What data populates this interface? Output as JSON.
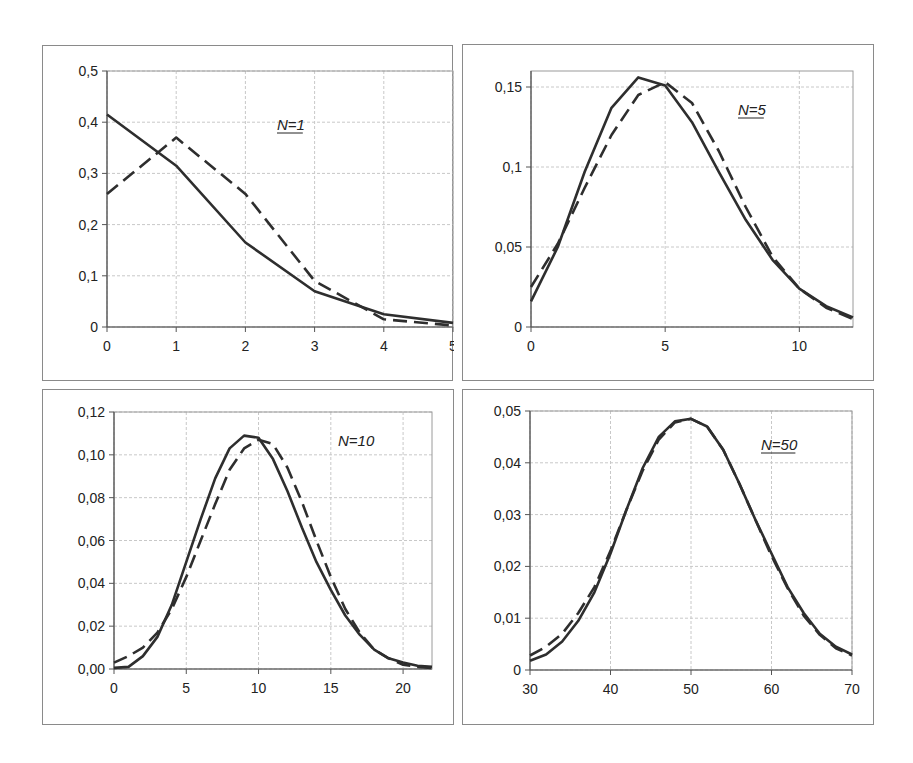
{
  "chart_data": [
    {
      "type": "line",
      "title": "",
      "annotation": "N=1",
      "annotation_underlined": true,
      "xlabel": "",
      "ylabel": "",
      "xlim": [
        0,
        5
      ],
      "ylim": [
        0,
        0.5
      ],
      "xticks": [
        0,
        1,
        2,
        3,
        4,
        5
      ],
      "xtick_labels": [
        "0",
        "1",
        "2",
        "3",
        "4",
        "5"
      ],
      "yticks": [
        0,
        0.1,
        0.2,
        0.3,
        0.4,
        0.5
      ],
      "ytick_labels": [
        "0",
        "0,1",
        "0,2",
        "0,3",
        "0,4",
        "0,5"
      ],
      "grid": true,
      "legend": null,
      "x": [
        0,
        1,
        2,
        3,
        4,
        5
      ],
      "series": [
        {
          "name": "solid",
          "style": "solid",
          "values": [
            0.415,
            0.315,
            0.165,
            0.07,
            0.025,
            0.008
          ]
        },
        {
          "name": "dashed",
          "style": "dashed",
          "values": [
            0.26,
            0.37,
            0.26,
            0.09,
            0.015,
            0.003
          ]
        }
      ]
    },
    {
      "type": "line",
      "title": "",
      "annotation": "N=5",
      "annotation_underlined": true,
      "xlabel": "",
      "ylabel": "",
      "xlim": [
        0,
        12
      ],
      "ylim": [
        0,
        0.16
      ],
      "xticks": [
        0,
        5,
        10
      ],
      "xtick_labels": [
        "0",
        "5",
        "10"
      ],
      "yticks": [
        0,
        0.05,
        0.1,
        0.15
      ],
      "ytick_labels": [
        "0",
        "0,05",
        "0,1",
        "0,15"
      ],
      "grid": true,
      "legend": null,
      "x": [
        0,
        1,
        2,
        3,
        4,
        5,
        6,
        7,
        8,
        9,
        10,
        11,
        12
      ],
      "series": [
        {
          "name": "solid",
          "style": "solid",
          "values": [
            0.016,
            0.05,
            0.097,
            0.137,
            0.156,
            0.151,
            0.128,
            0.097,
            0.067,
            0.042,
            0.024,
            0.013,
            0.006
          ]
        },
        {
          "name": "dashed",
          "style": "dashed",
          "values": [
            0.025,
            0.052,
            0.087,
            0.12,
            0.145,
            0.153,
            0.14,
            0.11,
            0.075,
            0.044,
            0.024,
            0.012,
            0.005
          ]
        }
      ]
    },
    {
      "type": "line",
      "title": "",
      "annotation": "N=10",
      "annotation_underlined": false,
      "xlabel": "",
      "ylabel": "",
      "xlim": [
        0,
        22
      ],
      "ylim": [
        0,
        0.12
      ],
      "xticks": [
        0,
        5,
        10,
        15,
        20
      ],
      "xtick_labels": [
        "0",
        "5",
        "10",
        "15",
        "20"
      ],
      "yticks": [
        0,
        0.02,
        0.04,
        0.06,
        0.08,
        0.1,
        0.12
      ],
      "ytick_labels": [
        "0,00",
        "0,02",
        "0,04",
        "0,06",
        "0,08",
        "0,10",
        "0,12"
      ],
      "grid": true,
      "legend": null,
      "x": [
        0,
        1,
        2,
        3,
        4,
        5,
        6,
        7,
        8,
        9,
        10,
        11,
        12,
        13,
        14,
        15,
        16,
        17,
        18,
        19,
        20,
        21,
        22
      ],
      "series": [
        {
          "name": "solid",
          "style": "solid",
          "values": [
            0.0005,
            0.001,
            0.006,
            0.015,
            0.03,
            0.05,
            0.07,
            0.089,
            0.103,
            0.109,
            0.108,
            0.098,
            0.083,
            0.066,
            0.05,
            0.037,
            0.025,
            0.016,
            0.009,
            0.005,
            0.003,
            0.0015,
            0.001
          ]
        },
        {
          "name": "dashed",
          "style": "dashed",
          "values": [
            0.003,
            0.006,
            0.01,
            0.017,
            0.028,
            0.043,
            0.06,
            0.077,
            0.093,
            0.103,
            0.107,
            0.105,
            0.094,
            0.078,
            0.06,
            0.043,
            0.028,
            0.017,
            0.009,
            0.005,
            0.002,
            0.001,
            0.0005
          ]
        }
      ]
    },
    {
      "type": "line",
      "title": "",
      "annotation": "N=50",
      "annotation_underlined": true,
      "xlabel": "",
      "ylabel": "",
      "xlim": [
        30,
        70
      ],
      "ylim": [
        0,
        0.05
      ],
      "xticks": [
        30,
        40,
        50,
        60,
        70
      ],
      "xtick_labels": [
        "30",
        "40",
        "50",
        "60",
        "70"
      ],
      "yticks": [
        0,
        0.01,
        0.02,
        0.03,
        0.04,
        0.05
      ],
      "ytick_labels": [
        "0",
        "0,01",
        "0,02",
        "0,03",
        "0,04",
        "0,05"
      ],
      "grid": true,
      "legend": null,
      "x": [
        30,
        32,
        34,
        36,
        38,
        40,
        42,
        44,
        46,
        48,
        50,
        52,
        54,
        56,
        58,
        60,
        62,
        64,
        66,
        68,
        70
      ],
      "series": [
        {
          "name": "solid",
          "style": "solid",
          "values": [
            0.0018,
            0.003,
            0.0055,
            0.0095,
            0.015,
            0.0225,
            0.031,
            0.039,
            0.045,
            0.048,
            0.0485,
            0.047,
            0.0425,
            0.036,
            0.029,
            0.0225,
            0.016,
            0.011,
            0.007,
            0.0045,
            0.003
          ]
        },
        {
          "name": "dashed",
          "style": "dashed",
          "values": [
            0.0028,
            0.0045,
            0.007,
            0.011,
            0.016,
            0.023,
            0.031,
            0.0385,
            0.0445,
            0.0478,
            0.0485,
            0.047,
            0.0425,
            0.036,
            0.029,
            0.022,
            0.0158,
            0.0105,
            0.0068,
            0.0042,
            0.0028
          ]
        }
      ]
    }
  ],
  "layout": {
    "line_color": "#2e2e2e",
    "grid_color": "#c8c8c8",
    "panels": [
      {
        "box": [
          42,
          45,
          411,
          336
        ],
        "plot": [
          106,
          70,
          452,
          326
        ],
        "label_pos": [
          276,
          129
        ]
      },
      {
        "box": [
          462,
          44,
          412,
          337
        ],
        "plot": [
          530,
          70,
          852,
          326
        ],
        "label_pos": [
          737,
          114
        ]
      },
      {
        "box": [
          42,
          389,
          412,
          336
        ],
        "plot": [
          113,
          411,
          431,
          668
        ],
        "label_pos": [
          337,
          445
        ]
      },
      {
        "box": [
          462,
          389,
          412,
          336
        ],
        "plot": [
          529,
          410,
          851,
          669
        ],
        "label_pos": [
          760,
          449
        ]
      }
    ]
  }
}
